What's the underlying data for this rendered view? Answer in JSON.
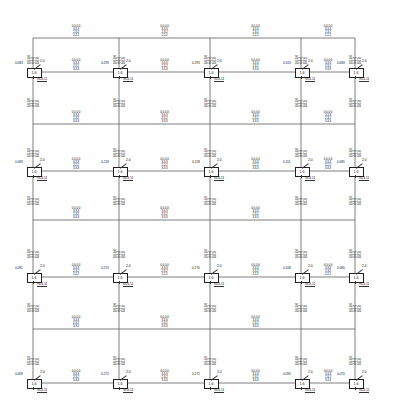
{
  "drawing": {
    "type": "structural-frame-elevation",
    "title": "Reinforced Concrete Frame Elevation",
    "line_color": "#555555",
    "text_color": "#141414",
    "background": "#fefefe"
  },
  "geometry": {
    "column_x": [
      33,
      119,
      210,
      301,
      355
    ],
    "beam_y": [
      38,
      72,
      124,
      171,
      220,
      277,
      329,
      383
    ],
    "support_levels": [
      72,
      171,
      277,
      383
    ],
    "plain_beam_levels": [
      38,
      124,
      220,
      329
    ]
  },
  "support_detail": {
    "box_label": "1.6",
    "dim_label": "2.0",
    "section_label": "GL4-11",
    "load_values": [
      "0.083",
      "0.293",
      "0.293",
      "0.103",
      "0.083",
      "0.083",
      "0.218",
      "0.218",
      "0.115",
      "0.085",
      "0.081",
      "0.270",
      "0.270",
      "0.108",
      "0.080",
      "0.069",
      "0.272",
      "0.272",
      "0.090",
      "0.070"
    ]
  },
  "midspan_blocks": [
    {
      "level": 38,
      "bay": 1,
      "lines": [
        "0.0-0.0",
        "3-3-3",
        "2-3-2",
        "2-2-2"
      ]
    },
    {
      "level": 38,
      "bay": 2,
      "lines": [
        "0.0-0.0",
        "3-3-3",
        "2-3-2",
        "2-2-2"
      ]
    },
    {
      "level": 38,
      "bay": 3,
      "lines": [
        "0.0-0.0",
        "3-3-3",
        "2-3-2",
        "2-2-2"
      ]
    },
    {
      "level": 38,
      "bay": 4,
      "lines": [
        "0.0-0.0",
        "3-3-3",
        "2-3-2",
        "2-2-2"
      ]
    },
    {
      "level": 72,
      "bay": 1,
      "lines": [
        "0.0-0.0",
        "3-3-3",
        "2-3-2",
        "3-3-3"
      ]
    },
    {
      "level": 72,
      "bay": 2,
      "lines": [
        "0.0-0.0",
        "3-3-3",
        "2-3-2",
        "3-3-3"
      ]
    },
    {
      "level": 72,
      "bay": 3,
      "lines": [
        "0.0-0.0",
        "3-3-3",
        "2-3-2",
        "3-3-3"
      ]
    },
    {
      "level": 72,
      "bay": 4,
      "lines": [
        "0.0-0.0",
        "3-3-3",
        "2-3-2",
        "3-3-3"
      ]
    },
    {
      "level": 124,
      "bay": 1,
      "lines": [
        "0.0-0.0",
        "3-3-3",
        "2-3-2",
        "3-3-3"
      ]
    },
    {
      "level": 124,
      "bay": 2,
      "lines": [
        "0.0-0.0",
        "3-3-3",
        "2-3-2",
        "3-3-3"
      ]
    },
    {
      "level": 124,
      "bay": 3,
      "lines": [
        "0.0-0.0",
        "3-3-3",
        "2-3-2",
        "3-3-3"
      ]
    },
    {
      "level": 124,
      "bay": 4,
      "lines": [
        "0.0-0.0",
        "3-3-3",
        "2-3-2",
        "3-3-3"
      ]
    },
    {
      "level": 171,
      "bay": 1,
      "lines": [
        "0.0-0.0",
        "3-3-3",
        "2-2-2",
        "3-3-3"
      ]
    },
    {
      "level": 171,
      "bay": 2,
      "lines": [
        "0.0-0.0",
        "3-3-3",
        "2-2-2",
        "3-3-3"
      ]
    },
    {
      "level": 171,
      "bay": 3,
      "lines": [
        "0.0-0.0",
        "3-3-3",
        "2-2-2",
        "3-3-3"
      ]
    },
    {
      "level": 171,
      "bay": 4,
      "lines": [
        "0.0-0.0",
        "3-3-3",
        "2-2-2",
        "3-3-3"
      ]
    },
    {
      "level": 220,
      "bay": 1,
      "lines": [
        "0.0-0.0",
        "3-3-3",
        "2-3-2",
        "3-3-3"
      ]
    },
    {
      "level": 220,
      "bay": 2,
      "lines": [
        "0.0-0.0",
        "3-3-3",
        "2-3-2",
        "3-3-3"
      ]
    },
    {
      "level": 220,
      "bay": 3,
      "lines": [
        "0.0-0.0",
        "3-3-3",
        "2-3-2",
        "3-3-3"
      ]
    },
    {
      "level": 277,
      "bay": 1,
      "lines": [
        "0.0-0.0",
        "3-3-3",
        "2-3-2",
        "2-2-2"
      ]
    },
    {
      "level": 277,
      "bay": 2,
      "lines": [
        "0.0-0.0",
        "3-3-3",
        "2-3-2",
        "2-2-2"
      ]
    },
    {
      "level": 277,
      "bay": 3,
      "lines": [
        "0.0-0.0",
        "3-3-3",
        "2-3-2",
        "2-2-2"
      ]
    },
    {
      "level": 277,
      "bay": 4,
      "lines": [
        "0.0-0.0",
        "3-3-3",
        "2-3-2",
        "2-2-2"
      ]
    },
    {
      "level": 329,
      "bay": 1,
      "lines": [
        "0.0-0.0",
        "3-3-3",
        "2-3-2",
        "3-3-1"
      ]
    },
    {
      "level": 329,
      "bay": 2,
      "lines": [
        "0.0-0.0",
        "3-3-3",
        "2-3-2",
        "3-3-3"
      ]
    },
    {
      "level": 329,
      "bay": 3,
      "lines": [
        "0.0-0.0",
        "3-3-3",
        "2-3-2",
        "3-3-3"
      ]
    },
    {
      "level": 383,
      "bay": 1,
      "lines": [
        "0.0-0.0",
        "3-3-3",
        "2-3-2",
        "3-3-3"
      ]
    },
    {
      "level": 383,
      "bay": 2,
      "lines": [
        "0.0-0.0",
        "3-3-3",
        "2-3-2",
        "3-3-3"
      ]
    },
    {
      "level": 383,
      "bay": 3,
      "lines": [
        "0.0-0.0",
        "3-3-3",
        "2-3-2",
        "3-3-3"
      ]
    },
    {
      "level": 383,
      "bay": 4,
      "lines": [
        "0.0-0.0",
        "3-3-3",
        "2-3-2",
        "3-3-3"
      ]
    }
  ],
  "column_blocks": [
    {
      "col": 0,
      "mid_y": 55,
      "lines": [
        "0.0-0.0",
        "3-3-3",
        "2-2-2",
        "0-0-0"
      ]
    },
    {
      "col": 0,
      "mid_y": 98,
      "lines": [
        "0.0-0.0",
        "3-3-3",
        "2-2-2",
        "0-0-0"
      ]
    },
    {
      "col": 0,
      "mid_y": 148,
      "lines": [
        "0.0-0.0",
        "3-3-3",
        "2-2-2",
        "0-0-0"
      ]
    },
    {
      "col": 0,
      "mid_y": 196,
      "lines": [
        "0.0-0.0",
        "3-3-3",
        "2-2-2",
        "0-0-0"
      ]
    },
    {
      "col": 0,
      "mid_y": 249,
      "lines": [
        "0.0-0.0",
        "3-3-3",
        "2-2-2",
        "0-0-0"
      ]
    },
    {
      "col": 0,
      "mid_y": 303,
      "lines": [
        "0.0-0.0",
        "3-3-3",
        "2-2-2",
        "0-0-0"
      ]
    },
    {
      "col": 0,
      "mid_y": 356,
      "lines": [
        "0.0-0.0",
        "3-3-3",
        "2-2-2",
        "0-0-0"
      ]
    },
    {
      "col": 1,
      "mid_y": 55,
      "lines": [
        "0.0-0.0",
        "3-3-3",
        "2-2-2",
        "0-0-0"
      ]
    },
    {
      "col": 1,
      "mid_y": 98,
      "lines": [
        "0.0-0.0",
        "3-3-3",
        "2-2-2",
        "0-0-0"
      ]
    },
    {
      "col": 1,
      "mid_y": 148,
      "lines": [
        "0.0-0.0",
        "3-3-3",
        "2-2-2",
        "0-0-0"
      ]
    },
    {
      "col": 1,
      "mid_y": 196,
      "lines": [
        "0.0-0.0",
        "3-3-3",
        "2-2-2",
        "0-0-0"
      ]
    },
    {
      "col": 1,
      "mid_y": 249,
      "lines": [
        "0.0-0.0",
        "3-3-3",
        "2-2-2",
        "0-0-0"
      ]
    },
    {
      "col": 1,
      "mid_y": 303,
      "lines": [
        "0.0-0.0",
        "3-3-3",
        "2-2-2",
        "0-0-0"
      ]
    },
    {
      "col": 1,
      "mid_y": 356,
      "lines": [
        "0.0-0.0",
        "3-3-3",
        "2-2-2",
        "0-0-0"
      ]
    },
    {
      "col": 2,
      "mid_y": 55,
      "lines": [
        "0.0-0.0",
        "3-3-3",
        "2-2-2",
        "0-0-0"
      ]
    },
    {
      "col": 2,
      "mid_y": 98,
      "lines": [
        "0.0-0.0",
        "3-3-3",
        "2-2-2",
        "0-0-0"
      ]
    },
    {
      "col": 2,
      "mid_y": 148,
      "lines": [
        "0.0-0.0",
        "3-3-3",
        "2-2-2",
        "0-0-0"
      ]
    },
    {
      "col": 2,
      "mid_y": 196,
      "lines": [
        "0.0-0.0",
        "3-3-3",
        "2-2-2",
        "0-0-0"
      ]
    },
    {
      "col": 2,
      "mid_y": 249,
      "lines": [
        "0.0-0.0",
        "3-3-3",
        "2-2-2",
        "0-0-0"
      ]
    },
    {
      "col": 2,
      "mid_y": 303,
      "lines": [
        "0.0-0.0",
        "3-3-3",
        "2-2-2",
        "0-0-0"
      ]
    },
    {
      "col": 2,
      "mid_y": 356,
      "lines": [
        "0.0-0.0",
        "3-3-3",
        "2-2-2",
        "0-0-0"
      ]
    },
    {
      "col": 3,
      "mid_y": 55,
      "lines": [
        "0.0-0.0",
        "3-3-3",
        "2-2-2",
        "0-0-0"
      ]
    },
    {
      "col": 3,
      "mid_y": 98,
      "lines": [
        "0.0-0.0",
        "3-3-3",
        "2-2-2",
        "0-0-0"
      ]
    },
    {
      "col": 3,
      "mid_y": 148,
      "lines": [
        "0.0-0.0",
        "3-3-3",
        "2-2-2",
        "0-0-0"
      ]
    },
    {
      "col": 3,
      "mid_y": 196,
      "lines": [
        "0.0-0.0",
        "3-3-3",
        "2-2-2",
        "0-0-0"
      ]
    },
    {
      "col": 3,
      "mid_y": 249,
      "lines": [
        "0.0-0.0",
        "3-3-3",
        "2-2-2",
        "0-0-0"
      ]
    },
    {
      "col": 3,
      "mid_y": 303,
      "lines": [
        "0.0-0.0",
        "3-3-3",
        "2-2-2",
        "0-0-0"
      ]
    },
    {
      "col": 3,
      "mid_y": 356,
      "lines": [
        "0.0-0.0",
        "3-3-3",
        "2-2-2",
        "0-0-0"
      ]
    },
    {
      "col": 4,
      "mid_y": 55,
      "lines": [
        "0.0-0.0",
        "3-3-3",
        "2-2-2",
        "0-0-0"
      ]
    },
    {
      "col": 4,
      "mid_y": 98,
      "lines": [
        "0.0-0.0",
        "3-3-3",
        "2-2-2",
        "0-0-0"
      ]
    },
    {
      "col": 4,
      "mid_y": 148,
      "lines": [
        "0.0-0.0",
        "3-3-3",
        "2-2-2",
        "0-0-0"
      ]
    },
    {
      "col": 4,
      "mid_y": 196,
      "lines": [
        "0.0-0.0",
        "3-3-3",
        "2-2-2",
        "0-0-0"
      ]
    },
    {
      "col": 4,
      "mid_y": 249,
      "lines": [
        "0.0-0.0",
        "3-3-3",
        "2-2-2",
        "0-0-0"
      ]
    },
    {
      "col": 4,
      "mid_y": 303,
      "lines": [
        "0.0-0.0",
        "3-3-3",
        "2-2-2",
        "0-0-0"
      ]
    },
    {
      "col": 4,
      "mid_y": 356,
      "lines": [
        "0.0-0.0",
        "3-3-3",
        "2-2-2",
        "0-0-0"
      ]
    }
  ]
}
